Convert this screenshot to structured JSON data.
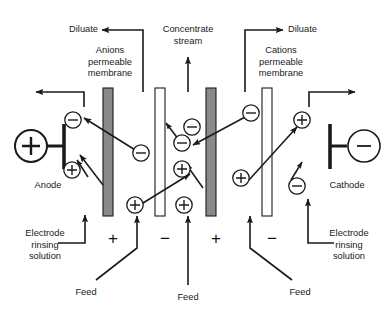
{
  "diagram": {
    "colors": {
      "ink": "#1a1a1a",
      "membrane_anion_fill": "#8a8a8a",
      "membrane_cation_fill": "#ffffff",
      "background": "#ffffff"
    },
    "labels": {
      "diluate_left": "Diluate",
      "diluate_right": "Diluate",
      "concentrate_stream": "Concentrate\nstream",
      "anions_membrane": "Anions\npermeable\nmembrane",
      "cations_membrane": "Cations\npermeable\nmembrane",
      "anode": "Anode",
      "cathode": "Cathode",
      "electrode_rinsing_left": "Electrode\nrinsing\nsolution",
      "electrode_rinsing_right": "Electrode\nrinsing\nsolution",
      "feed_left": "Feed",
      "feed_center": "Feed",
      "feed_right": "Feed"
    },
    "electrodes": [
      {
        "name": "anode",
        "polarity": "+",
        "label": "Anode",
        "side": "left"
      },
      {
        "name": "cathode",
        "polarity": "−",
        "label": "Cathode",
        "side": "right"
      }
    ],
    "membranes": [
      {
        "id": "m1",
        "type": "anion-permeable",
        "fill": "shaded",
        "x": 103
      },
      {
        "id": "m2",
        "type": "cation-permeable",
        "fill": "hollow",
        "x": 155
      },
      {
        "id": "m3",
        "type": "anion-permeable",
        "fill": "shaded",
        "x": 206
      },
      {
        "id": "m4",
        "type": "cation-permeable",
        "fill": "hollow",
        "x": 262
      }
    ],
    "compartment_signs": [
      {
        "sign": "+",
        "x": 113
      },
      {
        "sign": "−",
        "x": 165
      },
      {
        "sign": "+",
        "x": 216
      },
      {
        "sign": "−",
        "x": 272
      }
    ],
    "ions": [
      {
        "charge": "−",
        "x": 73,
        "y": 120
      },
      {
        "charge": "+",
        "x": 72,
        "y": 170
      },
      {
        "charge": "−",
        "x": 141,
        "y": 153
      },
      {
        "charge": "+",
        "x": 135,
        "y": 205
      },
      {
        "charge": "−",
        "x": 192,
        "y": 127
      },
      {
        "charge": "−",
        "x": 182,
        "y": 143
      },
      {
        "charge": "+",
        "x": 182,
        "y": 169
      },
      {
        "charge": "+",
        "x": 184,
        "y": 205
      },
      {
        "charge": "−",
        "x": 251,
        "y": 113
      },
      {
        "charge": "+",
        "x": 241,
        "y": 178
      },
      {
        "charge": "+",
        "x": 302,
        "y": 120
      },
      {
        "charge": "−",
        "x": 297,
        "y": 186
      }
    ]
  }
}
